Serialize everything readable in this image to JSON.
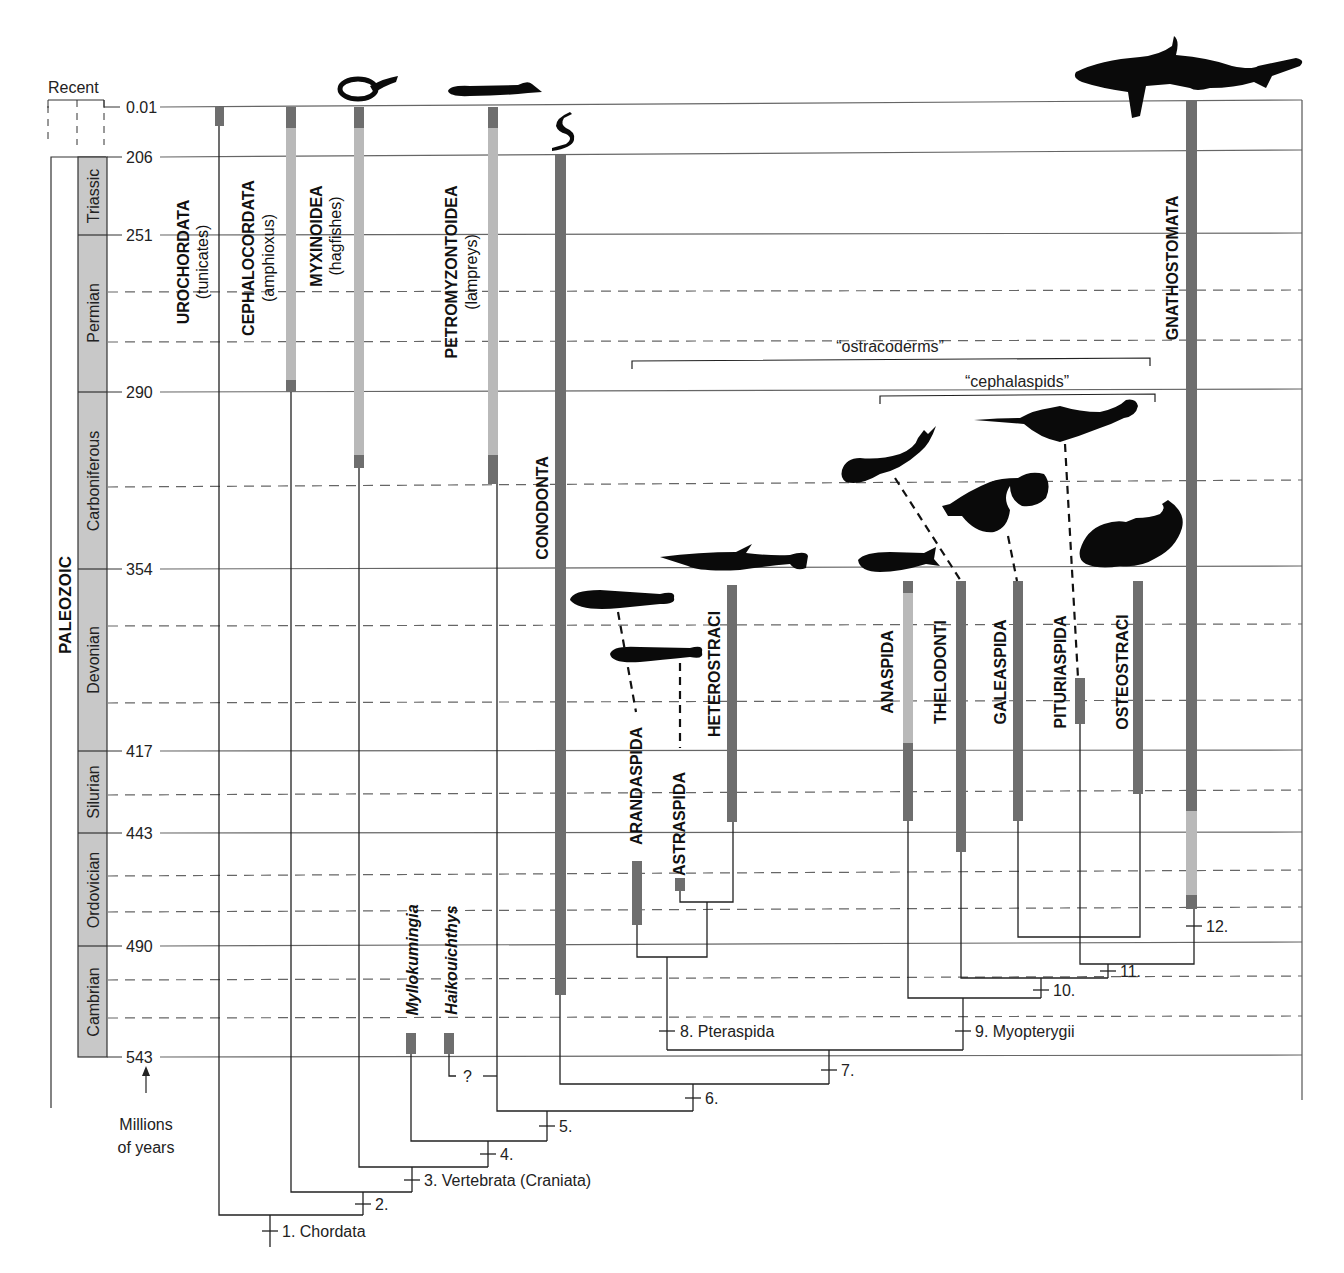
{
  "figure": {
    "recent_label": "Recent",
    "axis_label_line1": "Millions",
    "axis_label_line2": "of years",
    "era_label": "PALEOZOIC",
    "time_ticks": [
      {
        "label": "0.01",
        "y": 107
      },
      {
        "label": "206",
        "y": 157
      },
      {
        "label": "251",
        "y": 235
      },
      {
        "label": "290",
        "y": 392
      },
      {
        "label": "354",
        "y": 569
      },
      {
        "label": "417",
        "y": 751
      },
      {
        "label": "443",
        "y": 833
      },
      {
        "label": "490",
        "y": 946
      },
      {
        "label": "543",
        "y": 1057
      }
    ],
    "dashed_lines_y": [
      292,
      342,
      487,
      626,
      703,
      795,
      876,
      912,
      980,
      1018
    ],
    "periods": [
      {
        "name": "Triassic",
        "top": 157,
        "bottom": 235
      },
      {
        "name": "Permian",
        "top": 235,
        "bottom": 392
      },
      {
        "name": "Carboniferous",
        "top": 392,
        "bottom": 569
      },
      {
        "name": "Devonian",
        "top": 569,
        "bottom": 751
      },
      {
        "name": "Silurian",
        "top": 751,
        "bottom": 833
      },
      {
        "name": "Ordovician",
        "top": 833,
        "bottom": 946
      },
      {
        "name": "Cambrian",
        "top": 946,
        "bottom": 1057
      }
    ],
    "taxa": [
      {
        "name": "UROCHORDATA",
        "common": "(tunicates)",
        "x": 219
      },
      {
        "name": "CEPHALOCORDATA",
        "common": "(amphioxus)",
        "x": 291
      },
      {
        "name": "MYXINOIDEA",
        "common": "(hagfishes)",
        "x": 359
      },
      {
        "name": "PETROMYZONTOIDEA",
        "common": "(lampreys)",
        "x": 493
      },
      {
        "name": "CONODONTA",
        "common": "",
        "x": 560
      },
      {
        "name": "ARANDASPIDA",
        "common": "",
        "x": 637
      },
      {
        "name": "ASTRASPIDA",
        "common": "",
        "x": 680
      },
      {
        "name": "HETEROSTRACI",
        "common": "",
        "x": 732
      },
      {
        "name": "ANASPIDA",
        "common": "",
        "x": 908
      },
      {
        "name": "THELODONTI",
        "common": "",
        "x": 961
      },
      {
        "name": "GALEASPIDA",
        "common": "",
        "x": 1018
      },
      {
        "name": "PITURIASPIDA",
        "common": "",
        "x": 1080
      },
      {
        "name": "OSTEOSTRACI",
        "common": "",
        "x": 1138
      },
      {
        "name": "GNATHOSTOMATA",
        "common": "",
        "x": 1191
      },
      {
        "name": "Myllokumingia",
        "common": "",
        "x": 411
      },
      {
        "name": "Haikouichthys",
        "common": "",
        "x": 449
      }
    ],
    "groups": [
      {
        "label": "“ostracoderms”"
      },
      {
        "label": "“cephalaspids”"
      }
    ],
    "nodes": [
      {
        "label": "1. Chordata"
      },
      {
        "label": "2."
      },
      {
        "label": "3. Vertebrata (Craniata)"
      },
      {
        "label": "4."
      },
      {
        "label": "5."
      },
      {
        "label": "6."
      },
      {
        "label": "7."
      },
      {
        "label": "8. Pteraspida"
      },
      {
        "label": "9. Myopterygii"
      },
      {
        "label": "10."
      },
      {
        "label": "11."
      },
      {
        "label": "12."
      }
    ],
    "uncertain_marker": "?",
    "colors": {
      "bar_dark": "#6e6e6e",
      "bar_light": "#b9b9b9",
      "period_fill": "#c8c8c8",
      "line": "#333333",
      "grid": "#555555",
      "silhouette": "#0a0a0a"
    }
  }
}
